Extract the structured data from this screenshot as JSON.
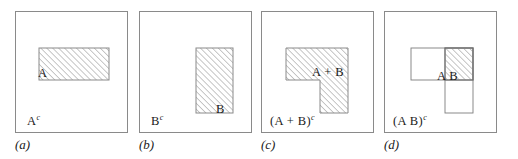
{
  "figure": {
    "type": "set-theory-venn-diagram",
    "background_color": "#ffffff",
    "border_color": "#8a8a8a",
    "hatch_color": "#9a9a9a",
    "text_color": "#1a1a1a",
    "panels": [
      {
        "id": "a",
        "caption": "(a)",
        "region_label": "A",
        "region_label_sup": "",
        "complement_label": "A",
        "complement_label_sup": "c",
        "shape": "single-horizontal-rectangle-shaded"
      },
      {
        "id": "b",
        "caption": "(b)",
        "region_label": "B",
        "region_label_sup": "",
        "complement_label": "B",
        "complement_label_sup": "c",
        "shape": "single-vertical-rectangle-shaded"
      },
      {
        "id": "c",
        "caption": "(c)",
        "region_label": "A + B",
        "region_label_sup": "",
        "complement_label": "(A + B)",
        "complement_label_sup": "c",
        "shape": "L-shaped-union-shaded"
      },
      {
        "id": "d",
        "caption": "(d)",
        "region_label": "A B",
        "region_label_sup": "",
        "complement_label": "(A B)",
        "complement_label_sup": "c",
        "shape": "intersection-overlap-shaded"
      }
    ]
  }
}
